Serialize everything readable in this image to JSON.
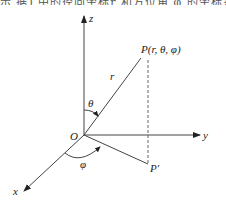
{
  "header_fragment": "示  据)   中的径向坐标r   和方位角   φ 的坐标系",
  "diagram": {
    "origin_label": "O",
    "axes": {
      "x": "x",
      "y": "y",
      "z": "z"
    },
    "point_label": "P(r, θ, φ)",
    "projection_label": "P′",
    "radius_label": "r",
    "polar_angle_label": "θ",
    "azimuth_angle_label": "φ"
  }
}
